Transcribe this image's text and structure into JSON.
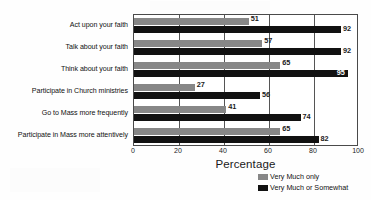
{
  "chart_data": {
    "type": "bar",
    "orientation": "horizontal",
    "title": "",
    "xlabel": "Percentage",
    "ylabel": "",
    "xlim": [
      0,
      100
    ],
    "xticks": [
      0,
      20,
      40,
      60,
      80,
      100
    ],
    "grid": true,
    "legend_position": "bottom-right",
    "categories": [
      "Act upon your faith",
      "Talk about your faith",
      "Think about your faith",
      "Participate in Church ministries",
      "Go to Mass more frequently",
      "Participate in Mass more attentively"
    ],
    "series": [
      {
        "name": "Very Much only",
        "color": "#878787",
        "values": [
          51,
          57,
          65,
          27,
          41,
          65
        ]
      },
      {
        "name": "Very Much or Somewhat",
        "color": "#111111",
        "values": [
          92,
          92,
          95,
          56,
          74,
          82
        ]
      }
    ]
  },
  "legend": {
    "items": [
      {
        "label": "Very Much only",
        "color": "#878787"
      },
      {
        "label": "Very Much or Somewhat",
        "color": "#111111"
      }
    ]
  },
  "axis": {
    "x_title": "Percentage",
    "tick_labels": [
      "0",
      "20",
      "40",
      "60",
      "80",
      "100"
    ]
  }
}
